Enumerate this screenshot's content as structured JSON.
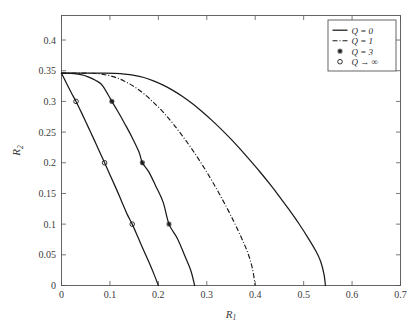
{
  "chart_data": {
    "type": "line",
    "title": "",
    "xlabel": "R_1",
    "xlabel_main": "R",
    "xlabel_sub": "1",
    "ylabel": "R_2",
    "ylabel_main": "R",
    "ylabel_sub": "2",
    "xlim": [
      0,
      0.7
    ],
    "ylim": [
      0,
      0.44
    ],
    "grid": false,
    "xticks": [
      0,
      0.1,
      0.2,
      0.3,
      0.4,
      0.5,
      0.6,
      0.7
    ],
    "xtick_labels": [
      "0",
      "0.1",
      "0.2",
      "0.3",
      "0.4",
      "0.5",
      "0.6",
      "0.7"
    ],
    "yticks": [
      0,
      0.05,
      0.1,
      0.15,
      0.2,
      0.25,
      0.3,
      0.35,
      0.4
    ],
    "ytick_labels": [
      "0",
      "0.05",
      "0.1",
      "0.15",
      "0.2",
      "0.25",
      "0.3",
      "0.35",
      "0.4"
    ],
    "legend_position": "upper right",
    "y_intercept": 0.346,
    "series": [
      {
        "name": "Q = 0",
        "legend_label": "Q = 0",
        "style": "solid",
        "marker": "none",
        "x_intercept": 0.545,
        "points": [
          [
            0.0,
            0.346
          ],
          [
            0.03,
            0.346
          ],
          [
            0.06,
            0.346
          ],
          [
            0.09,
            0.346
          ],
          [
            0.11,
            0.3455
          ],
          [
            0.13,
            0.3445
          ],
          [
            0.15,
            0.3425
          ],
          [
            0.17,
            0.339
          ],
          [
            0.19,
            0.3335
          ],
          [
            0.21,
            0.3265
          ],
          [
            0.23,
            0.318
          ],
          [
            0.25,
            0.308
          ],
          [
            0.27,
            0.2965
          ],
          [
            0.29,
            0.2835
          ],
          [
            0.31,
            0.2695
          ],
          [
            0.33,
            0.2545
          ],
          [
            0.35,
            0.2385
          ],
          [
            0.37,
            0.2215
          ],
          [
            0.39,
            0.2035
          ],
          [
            0.41,
            0.185
          ],
          [
            0.43,
            0.1655
          ],
          [
            0.45,
            0.145
          ],
          [
            0.47,
            0.1235
          ],
          [
            0.49,
            0.101
          ],
          [
            0.51,
            0.0765
          ],
          [
            0.525,
            0.0565
          ],
          [
            0.535,
            0.0395
          ],
          [
            0.542,
            0.0185
          ],
          [
            0.545,
            0.0
          ]
        ]
      },
      {
        "name": "Q = 1",
        "legend_label": "Q = 1",
        "style": "dashdot",
        "marker": "none",
        "x_intercept": 0.4,
        "points": [
          [
            0.0,
            0.346
          ],
          [
            0.025,
            0.346
          ],
          [
            0.05,
            0.346
          ],
          [
            0.07,
            0.3455
          ],
          [
            0.09,
            0.3435
          ],
          [
            0.11,
            0.3395
          ],
          [
            0.13,
            0.333
          ],
          [
            0.15,
            0.324
          ],
          [
            0.17,
            0.3125
          ],
          [
            0.19,
            0.2985
          ],
          [
            0.21,
            0.2825
          ],
          [
            0.23,
            0.264
          ],
          [
            0.25,
            0.2435
          ],
          [
            0.27,
            0.2215
          ],
          [
            0.29,
            0.1975
          ],
          [
            0.31,
            0.1715
          ],
          [
            0.33,
            0.1435
          ],
          [
            0.35,
            0.1135
          ],
          [
            0.37,
            0.0805
          ],
          [
            0.385,
            0.0525
          ],
          [
            0.394,
            0.0285
          ],
          [
            0.4,
            0.0
          ]
        ]
      },
      {
        "name": "Q = 3",
        "legend_label": "Q = 3",
        "style": "solid",
        "marker": "star",
        "x_intercept": 0.275,
        "marker_points": [
          [
            0.104,
            0.3
          ],
          [
            0.167,
            0.2
          ],
          [
            0.222,
            0.1
          ]
        ],
        "points": [
          [
            0.0,
            0.346
          ],
          [
            0.02,
            0.3455
          ],
          [
            0.04,
            0.3435
          ],
          [
            0.055,
            0.34
          ],
          [
            0.07,
            0.3345
          ],
          [
            0.085,
            0.3255
          ],
          [
            0.104,
            0.3
          ],
          [
            0.115,
            0.2855
          ],
          [
            0.13,
            0.2645
          ],
          [
            0.145,
            0.2425
          ],
          [
            0.16,
            0.2175
          ],
          [
            0.167,
            0.2
          ],
          [
            0.18,
            0.1855
          ],
          [
            0.195,
            0.1615
          ],
          [
            0.21,
            0.1355
          ],
          [
            0.222,
            0.1
          ],
          [
            0.24,
            0.0755
          ],
          [
            0.255,
            0.0475
          ],
          [
            0.267,
            0.0245
          ],
          [
            0.275,
            0.0
          ]
        ]
      },
      {
        "name": "Q → ∞",
        "legend_label": "Q → ∞",
        "style": "solid",
        "marker": "circle",
        "x_intercept": 0.2,
        "marker_points": [
          [
            0.03,
            0.3
          ],
          [
            0.089,
            0.2
          ],
          [
            0.146,
            0.1
          ]
        ],
        "points": [
          [
            0.0,
            0.346
          ],
          [
            0.01,
            0.33
          ],
          [
            0.02,
            0.3145
          ],
          [
            0.03,
            0.3
          ],
          [
            0.042,
            0.2805
          ],
          [
            0.055,
            0.2585
          ],
          [
            0.068,
            0.2365
          ],
          [
            0.08,
            0.2155
          ],
          [
            0.089,
            0.2
          ],
          [
            0.1,
            0.1805
          ],
          [
            0.112,
            0.1595
          ],
          [
            0.124,
            0.1375
          ],
          [
            0.136,
            0.1155
          ],
          [
            0.146,
            0.1
          ],
          [
            0.158,
            0.0785
          ],
          [
            0.17,
            0.0565
          ],
          [
            0.182,
            0.0355
          ],
          [
            0.192,
            0.0165
          ],
          [
            0.2,
            0.0
          ]
        ]
      }
    ]
  },
  "legend": {
    "entries": [
      {
        "label": "Q = 0",
        "style": "solid",
        "marker": "none"
      },
      {
        "label": "Q = 1",
        "style": "dashdot",
        "marker": "none"
      },
      {
        "label": "Q = 3",
        "style": "none",
        "marker": "star"
      },
      {
        "label": "Q → ∞",
        "style": "none",
        "marker": "circle"
      }
    ]
  },
  "colors": {
    "background": "#ffffff",
    "curve": "#1a1a1a",
    "axis": "#555555",
    "text": "#3b3b3b"
  }
}
